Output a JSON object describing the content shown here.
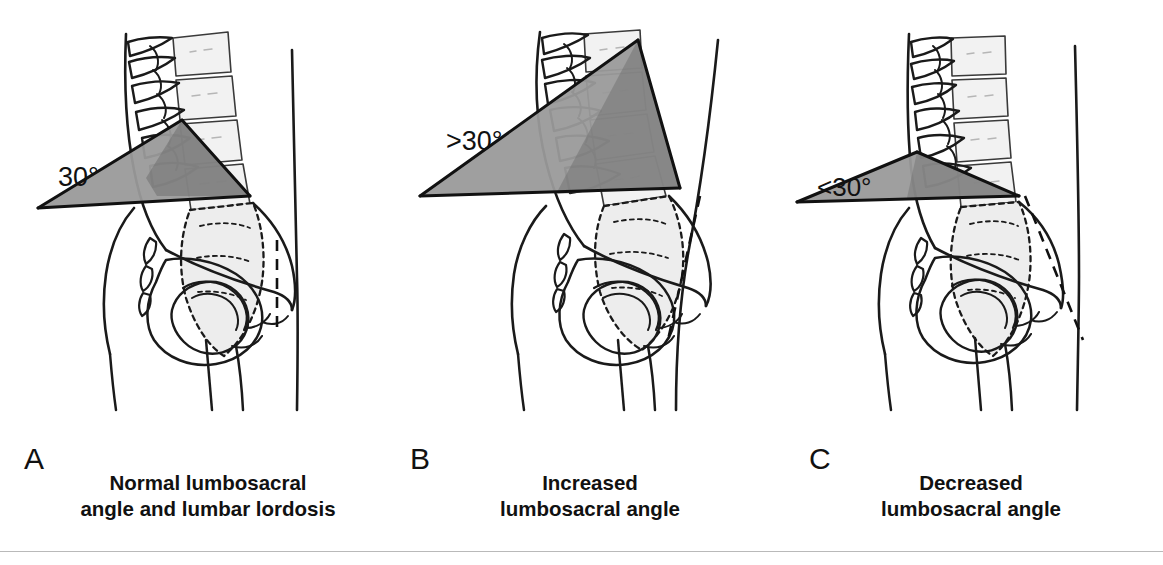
{
  "figure": {
    "kind": "medical-illustration",
    "background_color": "#ffffff",
    "ink_color": "#1a1a1a",
    "wedge_fill_color": "#9a9a9a",
    "wedge_overlap_color": "#6f6f6f",
    "bone_shadow_color": "#cfcfcf"
  },
  "panels": [
    {
      "id": "a",
      "letter": "A",
      "angle_label": "30°",
      "caption_lines": [
        "Normal lumbosacral",
        "angle and lumbar lordosis"
      ],
      "plumb_line": "vertical",
      "lordosis": "normal",
      "wedge_degrees": 30
    },
    {
      "id": "b",
      "letter": "B",
      "angle_label": ">30°",
      "caption_lines": [
        "Increased",
        "lumbosacral angle"
      ],
      "plumb_line": "tilted-forward",
      "lordosis": "increased",
      "wedge_degrees": 42
    },
    {
      "id": "c",
      "letter": "C",
      "angle_label": "<30°",
      "caption_lines": [
        "Decreased",
        "lumbosacral angle"
      ],
      "plumb_line": "tilted-backward",
      "lordosis": "decreased",
      "wedge_degrees": 16
    }
  ]
}
